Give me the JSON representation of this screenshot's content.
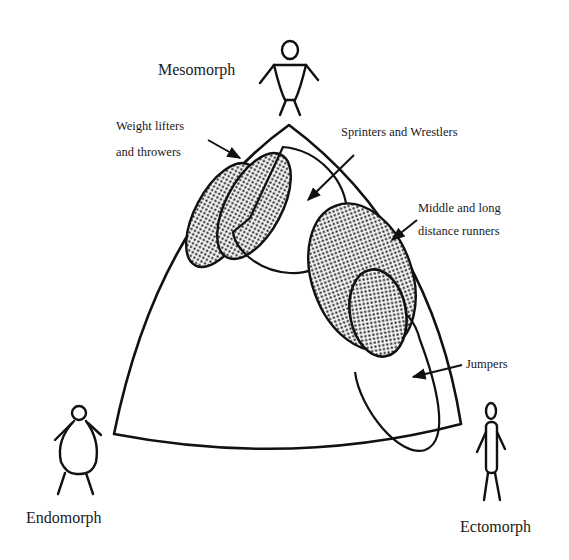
{
  "diagram": {
    "vertices": {
      "top": {
        "label": "Mesomorph",
        "icon": "mesomorph-figure-icon"
      },
      "bottom_left": {
        "label": "Endomorph",
        "icon": "endomorph-figure-icon"
      },
      "bottom_right": {
        "label": "Ectomorph",
        "icon": "ectomorph-figure-icon"
      }
    },
    "regions": [
      {
        "id": "weight-lifters",
        "label_line1": "Weight lifters",
        "label_line2": "and throwers",
        "shaded": true
      },
      {
        "id": "sprinters",
        "label": "Sprinters and Wrestlers",
        "shaded": false
      },
      {
        "id": "distance-runners",
        "label_line1": "Middle and long",
        "label_line2": "distance runners",
        "shaded": true
      },
      {
        "id": "jumpers",
        "label": "Jumpers",
        "shaded": false
      }
    ],
    "colors": {
      "ink": "#111111",
      "background": "#ffffff"
    }
  }
}
